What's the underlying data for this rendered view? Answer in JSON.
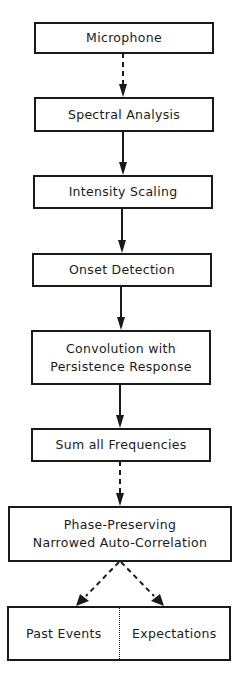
{
  "diagram": {
    "nodes": [
      {
        "id": "microphone",
        "label": "Microphone"
      },
      {
        "id": "spectral",
        "label": "Spectral Analysis"
      },
      {
        "id": "intensity",
        "label": "Intensity Scaling"
      },
      {
        "id": "onset",
        "label": "Onset Detection"
      },
      {
        "id": "convolution",
        "label_line1": "Convolution with",
        "label_line2": "Persistence Response"
      },
      {
        "id": "sum",
        "label": "Sum all Frequencies"
      },
      {
        "id": "phase",
        "label_line1": "Phase-Preserving",
        "label_line2": "Narrowed Auto-Correlation"
      },
      {
        "id": "output",
        "left_label": "Past Events",
        "right_label": "Expectations"
      }
    ],
    "edges": [
      {
        "from": "microphone",
        "to": "spectral",
        "style": "dashed"
      },
      {
        "from": "spectral",
        "to": "intensity",
        "style": "solid"
      },
      {
        "from": "intensity",
        "to": "onset",
        "style": "solid"
      },
      {
        "from": "onset",
        "to": "convolution",
        "style": "solid"
      },
      {
        "from": "convolution",
        "to": "sum",
        "style": "solid"
      },
      {
        "from": "sum",
        "to": "phase",
        "style": "dashed"
      },
      {
        "from": "phase",
        "to": "output.past_events",
        "style": "dashed"
      },
      {
        "from": "phase",
        "to": "output.expectations",
        "style": "dashed"
      }
    ],
    "colors": {
      "stroke": "#1a1a1a",
      "background": "#ffffff"
    }
  }
}
